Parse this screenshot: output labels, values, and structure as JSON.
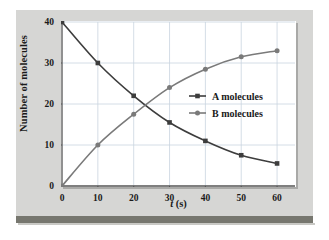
{
  "figure": {
    "background_color": "#d6d6d4",
    "plot_background_color": "#ffffff",
    "rule_color": "#77776f"
  },
  "axes": {
    "x_label_prefix": "t",
    "x_label_suffix": " (s)",
    "y_label": "Number of molecules"
  },
  "chart_data": {
    "type": "line",
    "title": "",
    "xlabel": "t (s)",
    "ylabel": "Number of molecules",
    "xlim": [
      0,
      65
    ],
    "ylim": [
      0,
      40
    ],
    "xticks": [
      0,
      10,
      20,
      30,
      40,
      50,
      60
    ],
    "xtick_labels": [
      "0",
      "10",
      "20",
      "30",
      "40",
      "50",
      "60"
    ],
    "yticks": [
      0,
      10,
      20,
      30,
      40
    ],
    "ytick_labels": [
      "0",
      "10",
      "20",
      "30",
      "40"
    ],
    "grid": true,
    "legend_position": "center-right",
    "x": [
      0,
      10,
      20,
      30,
      40,
      50,
      60
    ],
    "series": [
      {
        "name": "A molecules",
        "color": "#3d3d3d",
        "marker": "square",
        "values": [
          40,
          30,
          22,
          15.5,
          11,
          7.5,
          5.5
        ]
      },
      {
        "name": "B molecules",
        "color": "#7a7a7a",
        "marker": "circle",
        "values": [
          0,
          10,
          17.5,
          24,
          28.5,
          31.5,
          33
        ]
      }
    ]
  },
  "legend": {
    "entries": [
      {
        "label": "A molecules"
      },
      {
        "label": "B molecules"
      }
    ]
  }
}
